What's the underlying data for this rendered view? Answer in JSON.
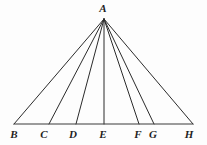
{
  "figure": {
    "background_color": "#fdfdfd",
    "line_color": "#2b2b2b",
    "base_line_color": "#3a3a3a",
    "label_color": "#1f1f1f"
  },
  "points": {
    "A": {
      "label": "A",
      "x": 104,
      "y": 19,
      "label_x": 103,
      "label_y": 12
    },
    "B": {
      "label": "B",
      "x": 14,
      "y": 124,
      "label_x": 14,
      "label_y": 138
    },
    "C": {
      "label": "C",
      "x": 49,
      "y": 124,
      "label_x": 44,
      "label_y": 138
    },
    "D": {
      "label": "D",
      "x": 76,
      "y": 124,
      "label_x": 73,
      "label_y": 138
    },
    "E": {
      "label": "E",
      "x": 104,
      "y": 124,
      "label_x": 103,
      "label_y": 138
    },
    "F": {
      "label": "F",
      "x": 139,
      "y": 124,
      "label_x": 138,
      "label_y": 138
    },
    "G": {
      "label": "G",
      "x": 154,
      "y": 124,
      "label_x": 153,
      "label_y": 138
    },
    "H": {
      "label": "H",
      "x": 193,
      "y": 124,
      "label_x": 189,
      "label_y": 138
    }
  },
  "segments": [
    {
      "name": "A-B",
      "from": "A",
      "to": "B"
    },
    {
      "name": "A-C",
      "from": "A",
      "to": "C"
    },
    {
      "name": "A-D",
      "from": "A",
      "to": "D"
    },
    {
      "name": "A-E",
      "from": "A",
      "to": "E"
    },
    {
      "name": "A-F",
      "from": "A",
      "to": "F"
    },
    {
      "name": "A-G",
      "from": "A",
      "to": "G"
    },
    {
      "name": "A-H",
      "from": "A",
      "to": "H"
    }
  ],
  "base_segment": {
    "name": "B-H",
    "from": "B",
    "to": "H"
  },
  "labels_order": [
    "B",
    "C",
    "D",
    "E",
    "F",
    "G",
    "H"
  ]
}
